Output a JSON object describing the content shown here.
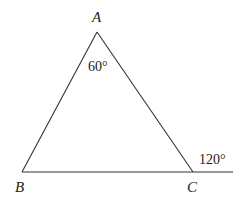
{
  "diagram": {
    "type": "triangle",
    "vertices": {
      "A": {
        "label": "A",
        "x": 97,
        "y": 32
      },
      "B": {
        "label": "B",
        "x": 22,
        "y": 172
      },
      "C": {
        "label": "C",
        "x": 193,
        "y": 172
      }
    },
    "extension_end": {
      "x": 233,
      "y": 172
    },
    "angles": {
      "interior_A": "60°",
      "exterior_C": "120°"
    },
    "stroke_color": "#333333"
  }
}
